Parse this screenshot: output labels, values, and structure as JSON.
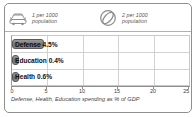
{
  "legend": {
    "items": [
      {
        "icon": "car-icon",
        "label": "1 per 1000\npopulation",
        "rate": 1,
        "per": 1000,
        "unit": "population"
      },
      {
        "icon": "ball-circle-icon",
        "label": "2 per 1000\npopulation",
        "rate": 2,
        "per": 1000,
        "unit": "population"
      }
    ]
  },
  "caption": "Defense, Health, Education spending as % of GDP",
  "colors": {
    "bar": "#7d7d7d",
    "bar_border": "#5a5a5a",
    "grid": "#d2d2d2",
    "frame": "#8f8f8f",
    "text": "#111111",
    "muted_text": "#555555"
  },
  "chart_data": {
    "type": "bar",
    "orientation": "horizontal",
    "title": "",
    "subtitle": "",
    "xlabel": "Defense, Health, Education spending as % of GDP",
    "ylabel": "",
    "categories": [
      "Defense",
      "Education",
      "Health"
    ],
    "values": [
      4.5,
      0.4,
      0.6
    ],
    "value_labels": [
      "4.5%",
      "0.4%",
      "0.6%"
    ],
    "bar_labels": [
      "Defense 4.5%",
      "Education 0.4%",
      "Health 0.6%"
    ],
    "xlim": [
      0,
      25
    ],
    "xticks": [
      0,
      5,
      10,
      15,
      20,
      25
    ],
    "xtick_labels": [
      "0",
      "5",
      "10",
      "15",
      "20",
      "25"
    ],
    "grid": true,
    "legend_position": "top"
  }
}
